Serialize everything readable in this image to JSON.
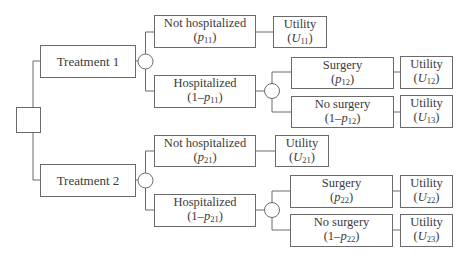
{
  "diagram": {
    "type": "decision-tree",
    "root": {
      "kind": "decision-node"
    },
    "branches": [
      {
        "label": "Treatment 1",
        "outcomes": [
          {
            "label": "Not hospitalized",
            "prob_prefix": "(",
            "prob_var": "p",
            "prob_sub": "11",
            "prob_suffix": ")",
            "utility": {
              "label": "Utility",
              "var": "U",
              "sub": "11"
            }
          },
          {
            "label": "Hospitalized",
            "prob_prefix": "(1–",
            "prob_var": "p",
            "prob_sub": "11",
            "prob_suffix": ")",
            "sub_outcomes": [
              {
                "label": "Surgery",
                "prob_prefix": "(",
                "prob_var": "p",
                "prob_sub": "12",
                "prob_suffix": ")",
                "utility": {
                  "label": "Utility",
                  "var": "U",
                  "sub": "12"
                }
              },
              {
                "label": "No surgery",
                "prob_prefix": "(1–",
                "prob_var": "p",
                "prob_sub": "12",
                "prob_suffix": ")",
                "utility": {
                  "label": "Utility",
                  "var": "U",
                  "sub": "13"
                }
              }
            ]
          }
        ]
      },
      {
        "label": "Treatment 2",
        "outcomes": [
          {
            "label": "Not hospitalized",
            "prob_prefix": "(",
            "prob_var": "p",
            "prob_sub": "21",
            "prob_suffix": ")",
            "utility": {
              "label": "Utility",
              "var": "U",
              "sub": "21"
            }
          },
          {
            "label": "Hospitalized",
            "prob_prefix": "(1–",
            "prob_var": "p",
            "prob_sub": "21",
            "prob_suffix": ")",
            "sub_outcomes": [
              {
                "label": "Surgery",
                "prob_prefix": "(",
                "prob_var": "p",
                "prob_sub": "22",
                "prob_suffix": ")",
                "utility": {
                  "label": "Utility",
                  "var": "U",
                  "sub": "22"
                }
              },
              {
                "label": "No surgery",
                "prob_prefix": "(1–",
                "prob_var": "p",
                "prob_sub": "22",
                "prob_suffix": ")",
                "utility": {
                  "label": "Utility",
                  "var": "U",
                  "sub": "23"
                }
              }
            ]
          }
        ]
      }
    ],
    "colors": {
      "line": "#6a6a6a",
      "text": "#3a3a3a",
      "background": "#ffffff"
    }
  }
}
